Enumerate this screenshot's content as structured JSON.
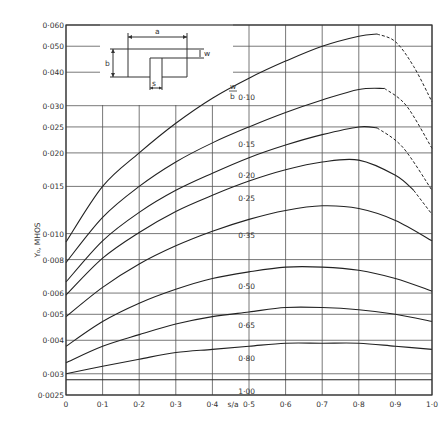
{
  "chart_data": {
    "type": "line",
    "title": "",
    "xlabel": "s/a",
    "ylabel": "Y₀, MHOS",
    "xlim": [
      0,
      1.0
    ],
    "ylim": [
      0.0025,
      0.06
    ],
    "yscale": "log",
    "grid": true,
    "legend_title": "w/b",
    "x_ticks": [
      "0",
      "0·1",
      "0·2",
      "0·3",
      "0·4",
      "0·5",
      "0·6",
      "0·7",
      "0·8",
      "0·9",
      "1·0"
    ],
    "y_ticks": [
      {
        "v": 0.06,
        "label": "0·060"
      },
      {
        "v": 0.05,
        "label": "0·050"
      },
      {
        "v": 0.04,
        "label": "0·040"
      },
      {
        "v": 0.03,
        "label": "0·030"
      },
      {
        "v": 0.025,
        "label": "0·025"
      },
      {
        "v": 0.02,
        "label": "0·020"
      },
      {
        "v": 0.015,
        "label": "0·015"
      },
      {
        "v": 0.01,
        "label": "0·010"
      },
      {
        "v": 0.008,
        "label": "0·008"
      },
      {
        "v": 0.006,
        "label": "0·006"
      },
      {
        "v": 0.005,
        "label": "0·005"
      },
      {
        "v": 0.004,
        "label": "0·004"
      },
      {
        "v": 0.003,
        "label": "0·003"
      },
      {
        "v": 0.0025,
        "label": "0·0025"
      }
    ],
    "series": [
      {
        "name": "0·10",
        "label_x": 0.46,
        "solid": [
          [
            0,
            0.0093
          ],
          [
            0.1,
            0.015
          ],
          [
            0.2,
            0.02
          ],
          [
            0.3,
            0.0258
          ],
          [
            0.4,
            0.032
          ],
          [
            0.5,
            0.038
          ],
          [
            0.6,
            0.044
          ],
          [
            0.7,
            0.05
          ],
          [
            0.8,
            0.0545
          ],
          [
            0.85,
            0.0555
          ]
        ],
        "dashed": [
          [
            0.85,
            0.0555
          ],
          [
            0.9,
            0.052
          ],
          [
            0.95,
            0.042
          ],
          [
            1.0,
            0.031
          ]
        ]
      },
      {
        "name": "0·15",
        "label_x": 0.46,
        "solid": [
          [
            0,
            0.0078
          ],
          [
            0.1,
            0.0115
          ],
          [
            0.2,
            0.015
          ],
          [
            0.3,
            0.0185
          ],
          [
            0.4,
            0.0218
          ],
          [
            0.5,
            0.025
          ],
          [
            0.6,
            0.0283
          ],
          [
            0.7,
            0.0315
          ],
          [
            0.8,
            0.0345
          ],
          [
            0.87,
            0.0348
          ]
        ],
        "dashed": [
          [
            0.87,
            0.0348
          ],
          [
            0.93,
            0.03
          ],
          [
            1.0,
            0.0208
          ]
        ]
      },
      {
        "name": "0·20",
        "label_x": 0.46,
        "solid": [
          [
            0,
            0.0066
          ],
          [
            0.1,
            0.0094
          ],
          [
            0.2,
            0.012
          ],
          [
            0.3,
            0.0145
          ],
          [
            0.4,
            0.0168
          ],
          [
            0.5,
            0.0192
          ],
          [
            0.6,
            0.0214
          ],
          [
            0.7,
            0.0234
          ],
          [
            0.8,
            0.025
          ],
          [
            0.85,
            0.0248
          ]
        ],
        "dashed": [
          [
            0.85,
            0.0248
          ],
          [
            0.92,
            0.021
          ],
          [
            1.0,
            0.0145
          ]
        ]
      },
      {
        "name": "0·25",
        "label_x": 0.46,
        "solid": [
          [
            0,
            0.0059
          ],
          [
            0.1,
            0.0081
          ],
          [
            0.2,
            0.0101
          ],
          [
            0.3,
            0.0121
          ],
          [
            0.4,
            0.0139
          ],
          [
            0.5,
            0.0157
          ],
          [
            0.6,
            0.0173
          ],
          [
            0.7,
            0.0185
          ],
          [
            0.8,
            0.0188
          ],
          [
            0.9,
            0.0165
          ],
          [
            0.95,
            0.0145
          ]
        ],
        "dashed": [
          [
            0.95,
            0.0145
          ],
          [
            1.0,
            0.0118
          ]
        ]
      },
      {
        "name": "0·35",
        "label_x": 0.46,
        "solid": [
          [
            0,
            0.0049
          ],
          [
            0.1,
            0.0063
          ],
          [
            0.2,
            0.0077
          ],
          [
            0.3,
            0.009
          ],
          [
            0.4,
            0.0102
          ],
          [
            0.5,
            0.0113
          ],
          [
            0.6,
            0.0122
          ],
          [
            0.7,
            0.0127
          ],
          [
            0.8,
            0.0124
          ],
          [
            0.9,
            0.0112
          ],
          [
            1.0,
            0.0094
          ]
        ],
        "dashed": []
      },
      {
        "name": "0·50",
        "label_x": 0.46,
        "solid": [
          [
            0,
            0.0038
          ],
          [
            0.1,
            0.0047
          ],
          [
            0.2,
            0.0055
          ],
          [
            0.3,
            0.0062
          ],
          [
            0.4,
            0.0068
          ],
          [
            0.5,
            0.0072
          ],
          [
            0.6,
            0.0075
          ],
          [
            0.7,
            0.0075
          ],
          [
            0.8,
            0.0073
          ],
          [
            0.9,
            0.0068
          ],
          [
            1.0,
            0.0061
          ]
        ],
        "dashed": []
      },
      {
        "name": "0·65",
        "label_x": 0.46,
        "solid": [
          [
            0,
            0.0033
          ],
          [
            0.1,
            0.0038
          ],
          [
            0.2,
            0.0042
          ],
          [
            0.3,
            0.0046
          ],
          [
            0.4,
            0.0049
          ],
          [
            0.5,
            0.0051
          ],
          [
            0.6,
            0.0053
          ],
          [
            0.7,
            0.0053
          ],
          [
            0.8,
            0.0052
          ],
          [
            0.9,
            0.005
          ],
          [
            1.0,
            0.0047
          ]
        ],
        "dashed": []
      },
      {
        "name": "0·80",
        "label_x": 0.46,
        "solid": [
          [
            0,
            0.003
          ],
          [
            0.1,
            0.0032
          ],
          [
            0.2,
            0.0034
          ],
          [
            0.3,
            0.0036
          ],
          [
            0.4,
            0.0037
          ],
          [
            0.5,
            0.0038
          ],
          [
            0.6,
            0.0039
          ],
          [
            0.7,
            0.0039
          ],
          [
            0.8,
            0.0039
          ],
          [
            0.9,
            0.0038
          ],
          [
            1.0,
            0.0037
          ]
        ],
        "dashed": []
      },
      {
        "name": "1·00",
        "label_x": 0.46,
        "solid": [
          [
            0,
            0.00285
          ],
          [
            1.0,
            0.00285
          ]
        ],
        "dashed": []
      }
    ],
    "inset_diagram": {
      "labels": {
        "a": "a",
        "b": "b",
        "w": "w",
        "s": "s"
      },
      "description": "rectangular aperture of width a and height b with ridge slot of width s; gap w"
    }
  }
}
